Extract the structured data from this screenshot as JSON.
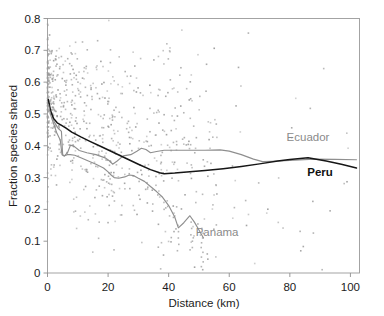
{
  "chart_data": {
    "type": "scatter",
    "title": "",
    "xlabel": "Distance (km)",
    "ylabel": "Fraction species shared",
    "xlim": [
      0,
      103
    ],
    "ylim": [
      0,
      0.8
    ],
    "xticks": [
      0,
      20,
      40,
      60,
      80,
      100
    ],
    "xtick_labels": [
      "0",
      "20",
      "40",
      "60",
      "80",
      "100"
    ],
    "yticks": [
      0,
      0.1,
      0.2,
      0.3,
      0.4,
      0.5,
      0.6,
      0.7,
      0.8
    ],
    "ytick_labels": [
      "0",
      "0.1",
      "0.2",
      "0.3",
      "0.4",
      "0.5",
      "0.6",
      "0.7",
      "0.8"
    ],
    "grid": false,
    "legend_position": "inline-annotations",
    "annotations": [
      {
        "text": "Ecuador",
        "x": 86,
        "y": 0.415,
        "color": "#8a8a8a",
        "style": "normal"
      },
      {
        "text": "Peru",
        "x": 90,
        "y": 0.305,
        "color": "#111111",
        "style": "bold"
      },
      {
        "text": "Panama",
        "x": 56,
        "y": 0.115,
        "color": "#8a8a8a",
        "style": "normal"
      }
    ],
    "series": [
      {
        "name": "Ecuador",
        "type": "line",
        "color": "#8f8f8f",
        "x": [
          0.3,
          1.2,
          2.2,
          3.5,
          4.6,
          5.0,
          5.6,
          6.6,
          7.6,
          8.8,
          10.5,
          13.0,
          16.0,
          19.0,
          20.5,
          21.5,
          23.0,
          25.0,
          27.5,
          29.5,
          31.0,
          32.5,
          34.0,
          36.0,
          38.5,
          43.0,
          47.0,
          52.0,
          57.0,
          60.0,
          64.0,
          68.0,
          71.0,
          74.0,
          80.0,
          88.0,
          95.0,
          102.0
        ],
        "y": [
          0.535,
          0.505,
          0.475,
          0.455,
          0.445,
          0.372,
          0.368,
          0.378,
          0.402,
          0.398,
          0.385,
          0.378,
          0.372,
          0.362,
          0.352,
          0.342,
          0.352,
          0.368,
          0.372,
          0.383,
          0.392,
          0.388,
          0.378,
          0.382,
          0.386,
          0.386,
          0.386,
          0.386,
          0.387,
          0.383,
          0.372,
          0.358,
          0.35,
          0.351,
          0.354,
          0.358,
          0.357,
          0.356
        ]
      },
      {
        "name": "Peru",
        "type": "line",
        "color": "#161616",
        "x": [
          0.3,
          1.0,
          2.0,
          3.2,
          4.5,
          6.0,
          8.0,
          11.0,
          14.0,
          18.0,
          22.0,
          26.0,
          30.0,
          34.0,
          37.0,
          38.5,
          42.0,
          47.0,
          52.0,
          58.0,
          64.0,
          70.0,
          76.0,
          80.0,
          86.0,
          92.0,
          97.0,
          102.0
        ],
        "y": [
          0.545,
          0.51,
          0.486,
          0.472,
          0.465,
          0.456,
          0.443,
          0.428,
          0.414,
          0.396,
          0.378,
          0.36,
          0.342,
          0.325,
          0.315,
          0.312,
          0.314,
          0.318,
          0.322,
          0.328,
          0.335,
          0.343,
          0.352,
          0.357,
          0.362,
          0.352,
          0.342,
          0.33
        ]
      },
      {
        "name": "Panama",
        "type": "line",
        "color": "#8f8f8f",
        "x": [
          0.3,
          1.0,
          2.0,
          3.0,
          4.2,
          4.8,
          5.5,
          6.5,
          7.5,
          9.0,
          11.0,
          13.5,
          16.0,
          18.5,
          20.0,
          21.0,
          22.0,
          23.5,
          25.5,
          27.0,
          28.5,
          30.0,
          32.0,
          34.0,
          36.0,
          38.0,
          40.0,
          42.0,
          43.2,
          45.0,
          47.0,
          48.5,
          50.0,
          51.5
        ],
        "y": [
          0.53,
          0.498,
          0.47,
          0.442,
          0.418,
          0.372,
          0.368,
          0.372,
          0.372,
          0.37,
          0.362,
          0.352,
          0.342,
          0.33,
          0.318,
          0.308,
          0.3,
          0.298,
          0.302,
          0.308,
          0.306,
          0.298,
          0.288,
          0.272,
          0.256,
          0.238,
          0.212,
          0.176,
          0.142,
          0.158,
          0.18,
          0.16,
          0.135,
          0.11
        ]
      }
    ],
    "scatter": {
      "name": "species-shared-observations",
      "color": "#9b9b9b",
      "marker": "square",
      "marker_size_px": 1.6,
      "n_points": 760,
      "description": "Dense cloud of pairwise comparisons, highest density near x=0-5 km spanning y=0.15-0.78, broadening and declining with distance; scattered outliers out to x=102 km between y=0.02 and y=0.45"
    }
  }
}
